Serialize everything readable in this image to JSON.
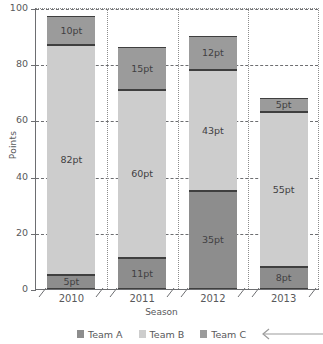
{
  "chart_data": {
    "type": "bar",
    "subtype": "stacked-vertical",
    "title": "",
    "xlabel": "Season",
    "ylabel": "Points",
    "categories": [
      "2010",
      "2011",
      "2012",
      "2013"
    ],
    "ylim": [
      0,
      100
    ],
    "yticks": [
      "0",
      "20",
      "40",
      "60",
      "80",
      "100"
    ],
    "ytick_values": [
      0,
      20,
      40,
      60,
      80,
      100
    ],
    "grid": "dashed-horizontal-dotted-vertical",
    "legend_position": "bottom",
    "series": [
      {
        "name": "Team A",
        "color": "#8d8d8d",
        "values": [
          5,
          11,
          35,
          8
        ],
        "labels": [
          "5pt",
          "11pt",
          "35pt",
          "8pt"
        ]
      },
      {
        "name": "Team B",
        "color": "#cdcdcd",
        "values": [
          82,
          60,
          43,
          55
        ],
        "labels": [
          "82pt",
          "60pt",
          "43pt",
          "55pt"
        ]
      },
      {
        "name": "Team C",
        "color": "#9b9b9b",
        "values": [
          10,
          15,
          12,
          5
        ],
        "labels": [
          "10pt",
          "15pt",
          "12pt",
          "5pt"
        ]
      }
    ],
    "totals": [
      97,
      86,
      90,
      68
    ]
  },
  "axes": {
    "y_title": "Points",
    "x_title": "Season",
    "y_ticks": [
      "100",
      "80",
      "60",
      "40",
      "20",
      "0"
    ],
    "x_ticks": [
      "2010",
      "2011",
      "2012",
      "2013"
    ]
  },
  "bars": [
    {
      "category": "2010",
      "segments": [
        {
          "series": "Team C",
          "label": "10pt",
          "value": 10
        },
        {
          "series": "Team B",
          "label": "82pt",
          "value": 82
        },
        {
          "series": "Team A",
          "label": "5pt",
          "value": 5
        }
      ]
    },
    {
      "category": "2011",
      "segments": [
        {
          "series": "Team C",
          "label": "15pt",
          "value": 15
        },
        {
          "series": "Team B",
          "label": "60pt",
          "value": 60
        },
        {
          "series": "Team A",
          "label": "11pt",
          "value": 11
        }
      ]
    },
    {
      "category": "2012",
      "segments": [
        {
          "series": "Team C",
          "label": "12pt",
          "value": 12
        },
        {
          "series": "Team B",
          "label": "43pt",
          "value": 43
        },
        {
          "series": "Team A",
          "label": "35pt",
          "value": 35
        }
      ]
    },
    {
      "category": "2013",
      "segments": [
        {
          "series": "Team C",
          "label": "5pt",
          "value": 5
        },
        {
          "series": "Team B",
          "label": "55pt",
          "value": 55
        },
        {
          "series": "Team A",
          "label": "8pt",
          "value": 8
        }
      ]
    }
  ],
  "legend": {
    "items": [
      {
        "label": "Team A",
        "color": "#8d8d8d"
      },
      {
        "label": "Team B",
        "color": "#cdcdcd"
      },
      {
        "label": "Team C",
        "color": "#9b9b9b"
      }
    ]
  },
  "annotation": {
    "arrow": "left-arrow-pointing-to-team-c",
    "color": "#9b9b9b"
  },
  "colors": {
    "team_a": "#8d8d8d",
    "team_b": "#cdcdcd",
    "team_c": "#9b9b9b",
    "axis": "#6d6e71",
    "text": "#58595b",
    "segment_border": "#3f3f3f",
    "background": "#ffffff"
  }
}
